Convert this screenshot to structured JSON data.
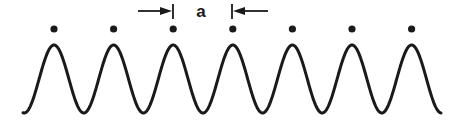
{
  "diagram": {
    "label": "a",
    "colors": {
      "ink": "#1a1a1a",
      "background": "#ffffff"
    },
    "dots": {
      "y": 29,
      "r": 3.6,
      "x": [
        54,
        113.6,
        173.2,
        232.8,
        292.4,
        352,
        411.6
      ]
    },
    "wave": {
      "x_start": 23,
      "x_end": 441,
      "first_peak_x": 54,
      "period": 59.6,
      "peak_y": 45,
      "trough_y": 113,
      "stroke_width": 3
    },
    "spacing_marker": {
      "left_tick_x": 173,
      "right_tick_x": 232,
      "tick_y1": 4,
      "tick_y2": 19,
      "arrow_y": 11,
      "left_arrow_from_x": 138,
      "right_arrow_from_x": 268,
      "label_x": 201,
      "label_y": 17
    }
  }
}
